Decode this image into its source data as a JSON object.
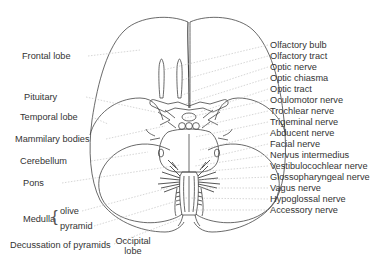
{
  "diagram": {
    "left_labels": [
      {
        "id": "frontal-lobe",
        "text": "Frontal lobe",
        "x": 22,
        "y": 55,
        "tx": 140,
        "ty": 50
      },
      {
        "id": "pituitary",
        "text": "Pituitary",
        "x": 24,
        "y": 96,
        "tx": 155,
        "ty": 112
      },
      {
        "id": "temporal-lobe",
        "text": "Temporal lobe",
        "x": 20,
        "y": 116,
        "tx": 108,
        "ty": 124
      },
      {
        "id": "mammilary-bodies",
        "text": "Mammilary bodies",
        "x": 15,
        "y": 138,
        "tx": 165,
        "ty": 126
      },
      {
        "id": "cerebellum",
        "text": "Cerebellum",
        "x": 20,
        "y": 160,
        "tx": 148,
        "ty": 152
      },
      {
        "id": "pons",
        "text": "Pons",
        "x": 23,
        "y": 182,
        "tx": 180,
        "ty": 165
      }
    ],
    "medulla": {
      "label": "Medulla",
      "x": 23,
      "y": 218,
      "parts": [
        {
          "id": "olive",
          "text": "olive",
          "x": 60,
          "y": 210,
          "tx": 168,
          "ty": 188
        },
        {
          "id": "pyramid",
          "text": "pyramid",
          "x": 60,
          "y": 225,
          "tx": 180,
          "ty": 200
        }
      ]
    },
    "bottom_labels": [
      {
        "id": "decussation",
        "text": "Decussation of pyramids",
        "x": 10,
        "y": 244,
        "tx": 182,
        "ty": 218
      },
      {
        "id": "occipital-lobe",
        "text": "Occipital\nlobe",
        "line1": "Occipital",
        "line2": "lobe",
        "x": 117,
        "y": 240
      }
    ],
    "right_labels": [
      {
        "id": "olfactory-bulb",
        "text": "Olfactory bulb",
        "y": 44,
        "tx": 163,
        "ty": 70
      },
      {
        "id": "olfactory-tract",
        "text": "Olfactory tract",
        "y": 55,
        "tx": 182,
        "ty": 80
      },
      {
        "id": "optic-nerve",
        "text": "Optic nerve",
        "y": 66,
        "tx": 182,
        "ty": 95
      },
      {
        "id": "optic-chiasma",
        "text": "Optic chiasma",
        "y": 77,
        "tx": 185,
        "ty": 104
      },
      {
        "id": "optic-tract",
        "text": "Optic tract",
        "y": 88,
        "tx": 200,
        "ty": 112
      },
      {
        "id": "oculomotor-nerve",
        "text": "Oculomotor nerve",
        "y": 99,
        "tx": 185,
        "ty": 118
      },
      {
        "id": "trochlear-nerve",
        "text": "Trochlear nerve",
        "y": 110,
        "tx": 198,
        "ty": 127
      },
      {
        "id": "trigeminal-nerve",
        "text": "Trigeminal nerve",
        "y": 121,
        "tx": 195,
        "ty": 137
      },
      {
        "id": "abducent-nerve",
        "text": "Abducent nerve",
        "y": 132,
        "tx": 200,
        "ty": 150
      },
      {
        "id": "facial-nerve",
        "text": "Facial nerve",
        "y": 143,
        "tx": 198,
        "ty": 160
      },
      {
        "id": "nervus-intermedius",
        "text": "Nervus intermedius",
        "y": 154,
        "tx": 195,
        "ty": 166
      },
      {
        "id": "vestibulocochlear-nerve",
        "text": "Vestibulocochlear nerve",
        "y": 165,
        "tx": 198,
        "ty": 172
      },
      {
        "id": "glossopharyngeal-nerve",
        "text": "Glossopharyngeal nerve",
        "y": 176,
        "tx": 196,
        "ty": 180
      },
      {
        "id": "vagus-nerve",
        "text": "Vagus nerve",
        "y": 187,
        "tx": 198,
        "ty": 188
      },
      {
        "id": "hypoglossal-nerve",
        "text": "Hypoglossal nerve",
        "y": 198,
        "tx": 185,
        "ty": 198
      },
      {
        "id": "accessory-nerve",
        "text": "Accessory nerve",
        "y": 209,
        "tx": 190,
        "ty": 210
      }
    ],
    "colors": {
      "outline": "#444444",
      "leader": "#bbbbbb",
      "text": "#333333",
      "background": "#ffffff"
    }
  }
}
